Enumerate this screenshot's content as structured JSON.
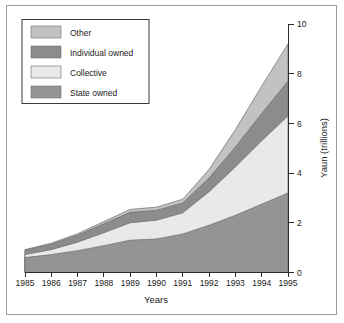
{
  "figure": {
    "background_color": "#ffffff",
    "frame_color": "#9b9b9b",
    "axis_color": "#2b2b2b"
  },
  "legend": {
    "position": "top-left",
    "border_color": "#3a3a3a",
    "items": [
      {
        "label": "Other",
        "color": "#c2c2c2"
      },
      {
        "label": "Individual owned",
        "color": "#8c8c8c"
      },
      {
        "label": "Collective",
        "color": "#e9e9e9"
      },
      {
        "label": "State owned",
        "color": "#949494"
      }
    ]
  },
  "axes": {
    "x": {
      "title": "Years",
      "tick_labels": [
        "1985",
        "1986",
        "1987",
        "1988",
        "1989",
        "1990",
        "1991",
        "1992",
        "1993",
        "1994",
        "1995"
      ]
    },
    "y": {
      "title": "Yaun (trillions)",
      "side": "right",
      "tick_labels": [
        "0",
        "2",
        "4",
        "6",
        "8",
        "10"
      ],
      "min": 0,
      "max": 10
    }
  },
  "chart_data": {
    "type": "area",
    "stacked": true,
    "title": "",
    "xlabel": "Years",
    "ylabel": "Yaun (trillions)",
    "ylim": [
      0,
      10
    ],
    "xlim": [
      1985,
      1995
    ],
    "grid": false,
    "legend_position": "top-left",
    "categories": [
      1985,
      1986,
      1987,
      1988,
      1989,
      1990,
      1991,
      1992,
      1993,
      1994,
      1995
    ],
    "series": [
      {
        "name": "State owned",
        "color": "#949494",
        "values": [
          0.6,
          0.72,
          0.88,
          1.08,
          1.3,
          1.35,
          1.55,
          1.9,
          2.3,
          2.75,
          3.2
        ]
      },
      {
        "name": "Collective",
        "color": "#e9e9e9",
        "values": [
          0.12,
          0.2,
          0.34,
          0.52,
          0.7,
          0.75,
          0.85,
          1.35,
          1.95,
          2.55,
          3.1
        ]
      },
      {
        "name": "Individual owned",
        "color": "#8c8c8c",
        "values": [
          0.18,
          0.22,
          0.28,
          0.36,
          0.42,
          0.4,
          0.4,
          0.55,
          0.8,
          1.1,
          1.4
        ]
      },
      {
        "name": "Other",
        "color": "#c2c2c2",
        "values": [
          0.02,
          0.04,
          0.06,
          0.09,
          0.12,
          0.13,
          0.15,
          0.35,
          0.7,
          1.1,
          1.5
        ]
      }
    ],
    "cumulative_tops": {
      "State owned": [
        0.6,
        0.72,
        0.88,
        1.08,
        1.3,
        1.35,
        1.55,
        1.9,
        2.3,
        2.75,
        3.2
      ],
      "Collective": [
        0.72,
        0.92,
        1.22,
        1.6,
        2.0,
        2.1,
        2.4,
        3.25,
        4.25,
        5.3,
        6.3
      ],
      "Individual owned": [
        0.9,
        1.14,
        1.5,
        1.96,
        2.42,
        2.5,
        2.8,
        3.8,
        5.05,
        6.4,
        7.7
      ],
      "Other": [
        0.92,
        1.18,
        1.56,
        2.05,
        2.54,
        2.63,
        2.95,
        4.15,
        5.75,
        7.5,
        9.2
      ]
    }
  }
}
